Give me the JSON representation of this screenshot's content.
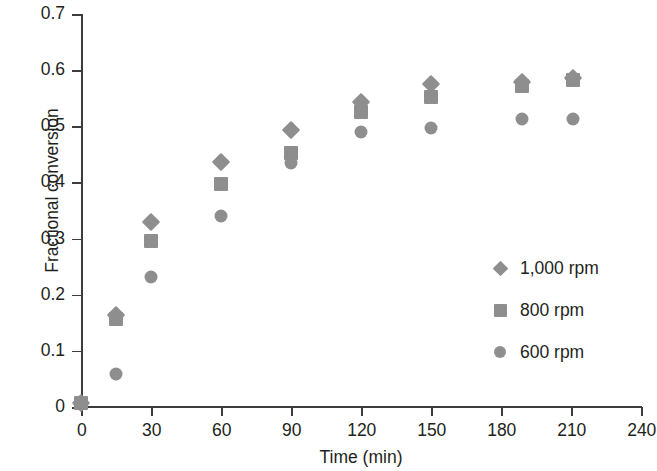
{
  "chart_data": {
    "type": "scatter",
    "title": "",
    "xlabel": "Time (min)",
    "ylabel": "Fractional conversion",
    "xlim": [
      0,
      240
    ],
    "ylim": [
      0,
      0.7
    ],
    "xticks": [
      "0",
      "30",
      "60",
      "90",
      "120",
      "150",
      "180",
      "210",
      "240"
    ],
    "xtick_values": [
      0,
      30,
      60,
      90,
      120,
      150,
      180,
      210,
      240
    ],
    "yticks": [
      "0",
      "0.1",
      "0.2",
      "0.3",
      "0.4",
      "0.5",
      "0.6",
      "0.7"
    ],
    "ytick_values": [
      0,
      0.1,
      0.2,
      0.3,
      0.4,
      0.5,
      0.6,
      0.7
    ],
    "grid": false,
    "legend_position": "center-right",
    "marker_color": "#8e8e8e",
    "axis_color": "#3c3c3c",
    "series": [
      {
        "name": "1,000 rpm",
        "marker": "diamond",
        "x": [
          0,
          15,
          30,
          60,
          90,
          120,
          150,
          189,
          211
        ],
        "y": [
          0.007,
          0.163,
          0.33,
          0.437,
          0.493,
          0.543,
          0.575,
          0.578,
          0.586
        ]
      },
      {
        "name": "800 rpm",
        "marker": "square",
        "x": [
          0,
          15,
          30,
          60,
          90,
          120,
          150,
          189,
          211
        ],
        "y": [
          0.007,
          0.156,
          0.296,
          0.398,
          0.452,
          0.525,
          0.553,
          0.572,
          0.582
        ]
      },
      {
        "name": "600 rpm",
        "marker": "circle",
        "x": [
          0,
          15,
          30,
          60,
          90,
          120,
          150,
          189,
          211
        ],
        "y": [
          0.007,
          0.059,
          0.232,
          0.34,
          0.434,
          0.49,
          0.497,
          0.513,
          0.513
        ]
      }
    ]
  },
  "legend": {
    "items": [
      {
        "label": "1,000 rpm",
        "marker": "diamond"
      },
      {
        "label": "800 rpm",
        "marker": "square"
      },
      {
        "label": "600 rpm",
        "marker": "circle"
      }
    ]
  }
}
